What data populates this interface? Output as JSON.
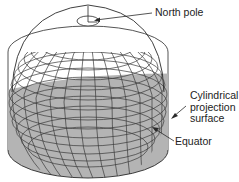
{
  "diagram": {
    "type": "cylindrical-projection-illustration",
    "colors": {
      "background": "#ffffff",
      "grid_line": "#3a3a3a",
      "cylinder_fill": "#b4b4b4",
      "outline": "#2a2a2a",
      "text": "#222222"
    },
    "labels": {
      "north_pole": "North pole",
      "cylinder_line1": "Cylindrical",
      "cylinder_line2": "projection",
      "cylinder_line3": "surface",
      "equator": "Equator"
    }
  }
}
